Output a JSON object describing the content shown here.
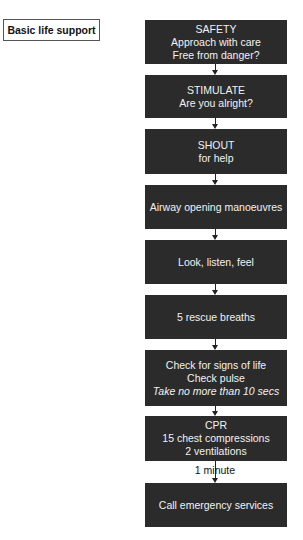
{
  "title": "Basic life support",
  "flowchart": {
    "box_color": "#2b2b2b",
    "text_color": "#f2f2f2",
    "steps": [
      {
        "id": "safety",
        "lines": [
          "SAFETY",
          "Approach with care",
          "Free from danger?"
        ],
        "italic_lines": []
      },
      {
        "id": "stimulate",
        "lines": [
          "STIMULATE",
          "Are you alright?"
        ],
        "italic_lines": []
      },
      {
        "id": "shout",
        "lines": [
          "SHOUT",
          "for help"
        ],
        "italic_lines": []
      },
      {
        "id": "airway",
        "lines": [
          "Airway opening manoeuvres"
        ],
        "italic_lines": []
      },
      {
        "id": "look-listen-feel",
        "lines": [
          "Look, listen, feel"
        ],
        "italic_lines": []
      },
      {
        "id": "rescue-breaths",
        "lines": [
          "5 rescue breaths"
        ],
        "italic_lines": []
      },
      {
        "id": "check-signs",
        "lines": [
          "Check for signs of life",
          "Check pulse",
          "Take no more than 10 secs"
        ],
        "italic_lines": [
          2
        ]
      },
      {
        "id": "cpr",
        "lines": [
          "CPR",
          "15 chest compressions",
          "2 ventilations"
        ],
        "italic_lines": []
      },
      {
        "id": "call-emergency",
        "lines": [
          "Call emergency services"
        ],
        "italic_lines": []
      }
    ],
    "edges": [
      {
        "from": "safety",
        "to": "stimulate",
        "label": ""
      },
      {
        "from": "stimulate",
        "to": "shout",
        "label": ""
      },
      {
        "from": "shout",
        "to": "airway",
        "label": ""
      },
      {
        "from": "airway",
        "to": "look-listen-feel",
        "label": ""
      },
      {
        "from": "look-listen-feel",
        "to": "rescue-breaths",
        "label": ""
      },
      {
        "from": "rescue-breaths",
        "to": "check-signs",
        "label": ""
      },
      {
        "from": "check-signs",
        "to": "cpr",
        "label": ""
      },
      {
        "from": "cpr",
        "to": "call-emergency",
        "label": "1 minute"
      }
    ]
  }
}
